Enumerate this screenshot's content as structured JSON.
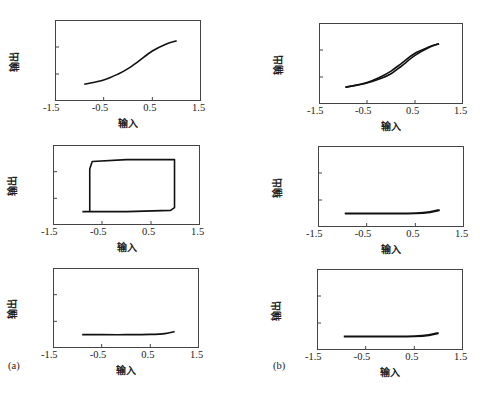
{
  "figure": {
    "panel_labels": {
      "a": "(a)",
      "b": "(b)"
    },
    "xlabel": "输入",
    "ylabel": "输出",
    "x_ticks": [
      "-1.5",
      "-0.5",
      "0.5",
      "1.5"
    ],
    "y_ticks": [
      "1.5",
      "0.5",
      "-0.5",
      "-1.5"
    ]
  },
  "panels": [
    {
      "id": "a1",
      "w_label": "W",
      "w_sub": "2",
      "w_value": "=0.25"
    },
    {
      "id": "b1",
      "w_label": "W",
      "w_sub": "2",
      "w_value": "=0.25"
    },
    {
      "id": "a2",
      "w_label": "W",
      "w_sub": "2",
      "w_value": "=2.45"
    },
    {
      "id": "b2",
      "w_label": "W",
      "w_sub": "2",
      "w_value": "=2.45"
    },
    {
      "id": "a3",
      "w_label": "W",
      "w_sub": "2",
      "w_value": "=2.50"
    },
    {
      "id": "b3",
      "w_label": "W",
      "w_sub": "2",
      "w_value": "=2.50"
    }
  ],
  "chart_data": [
    {
      "type": "line",
      "title": "(a) W2=0.25",
      "xlabel": "输入",
      "ylabel": "输出",
      "xlim": [
        -1.5,
        1.5
      ],
      "ylim": [
        -1.5,
        1.5
      ],
      "x": [
        -0.9,
        -0.5,
        -0.2,
        0.0,
        0.2,
        0.5,
        0.8,
        1.0
      ],
      "series": [
        {
          "name": "output",
          "values": [
            -0.88,
            -0.72,
            -0.5,
            -0.3,
            -0.05,
            0.35,
            0.62,
            0.73
          ]
        }
      ]
    },
    {
      "type": "line",
      "title": "(b) W2=0.25",
      "xlabel": "输入",
      "ylabel": "输出",
      "xlim": [
        -1.5,
        1.5
      ],
      "ylim": [
        -1.5,
        1.5
      ],
      "x": [
        -0.95,
        -0.5,
        -0.2,
        0.0,
        0.2,
        0.5,
        0.8,
        1.0
      ],
      "series": [
        {
          "name": "forward",
          "values": [
            -0.88,
            -0.7,
            -0.48,
            -0.28,
            -0.02,
            0.38,
            0.62,
            0.73
          ]
        },
        {
          "name": "backward",
          "values": [
            -0.88,
            -0.72,
            -0.55,
            -0.38,
            -0.12,
            0.3,
            0.6,
            0.73
          ]
        }
      ]
    },
    {
      "type": "line",
      "title": "(a) W2=2.45",
      "xlabel": "输入",
      "ylabel": "输出",
      "xlim": [
        -1.5,
        1.5
      ],
      "ylim": [
        -1.5,
        1.5
      ],
      "x": [
        -0.9,
        -0.75,
        -0.75,
        -0.7,
        0.0,
        0.98,
        0.98,
        0.9,
        0.0,
        -0.9
      ],
      "series": [
        {
          "name": "hysteresis loop",
          "values": [
            -1.0,
            -1.0,
            0.6,
            0.88,
            0.95,
            0.95,
            -0.85,
            -0.95,
            -1.0,
            -1.0
          ]
        }
      ]
    },
    {
      "type": "line",
      "title": "(b) W2=2.45",
      "xlabel": "输入",
      "ylabel": "输出",
      "xlim": [
        -1.5,
        1.5
      ],
      "ylim": [
        -1.5,
        1.5
      ],
      "x": [
        -0.95,
        -0.5,
        0.0,
        0.5,
        0.8,
        1.0
      ],
      "series": [
        {
          "name": "output",
          "values": [
            -1.0,
            -1.0,
            -1.0,
            -0.99,
            -0.95,
            -0.87
          ]
        }
      ]
    },
    {
      "type": "line",
      "title": "(a) W2=2.50",
      "xlabel": "输入",
      "ylabel": "输出",
      "xlim": [
        -1.5,
        1.5
      ],
      "ylim": [
        -1.5,
        1.5
      ],
      "x": [
        -0.9,
        -0.5,
        0.0,
        0.5,
        0.8,
        1.0
      ],
      "series": [
        {
          "name": "output",
          "values": [
            -1.0,
            -1.0,
            -1.0,
            -0.99,
            -0.96,
            -0.88
          ]
        }
      ]
    },
    {
      "type": "line",
      "title": "(b) W2=2.50",
      "xlabel": "输入",
      "ylabel": "输出",
      "xlim": [
        -1.5,
        1.5
      ],
      "ylim": [
        -1.5,
        1.5
      ],
      "x": [
        -0.95,
        -0.5,
        0.0,
        0.5,
        0.8,
        1.0
      ],
      "series": [
        {
          "name": "output",
          "values": [
            -1.0,
            -1.0,
            -1.0,
            -0.99,
            -0.95,
            -0.87
          ]
        }
      ]
    }
  ]
}
